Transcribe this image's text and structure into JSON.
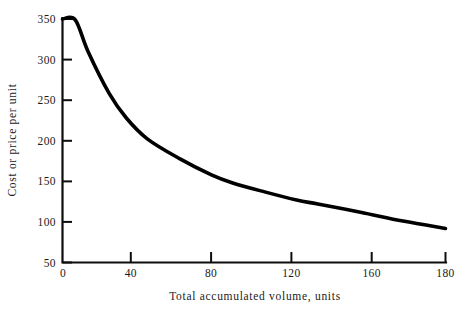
{
  "chart_data": {
    "type": "line",
    "title": "",
    "xlabel": "Total accumulated volume, units",
    "ylabel": "Cost or price per unit",
    "xlim": [
      0,
      180
    ],
    "ylim": [
      50,
      350
    ],
    "grid": false,
    "legend": "none",
    "xticks": [
      0,
      40,
      80,
      120,
      160,
      180
    ],
    "xtick_labels": [
      "0",
      "40",
      "80",
      "120",
      "160",
      "180"
    ],
    "yticks": [
      50,
      100,
      150,
      200,
      250,
      300,
      350
    ],
    "ytick_labels": [
      "50",
      "100",
      "150",
      "200",
      "250",
      "300",
      "350"
    ],
    "series": [
      {
        "name": "Cost or price per unit",
        "color": "#000000",
        "x": [
          0,
          6,
          12,
          22,
          30,
          40,
          55,
          70,
          80,
          95,
          110,
          120,
          140,
          160,
          180
        ],
        "values": [
          350,
          349,
          310,
          258,
          228,
          202,
          178,
          158,
          148,
          137,
          127,
          122,
          112,
          101,
          92
        ]
      }
    ]
  },
  "axis": {
    "y_title": "Cost or price per unit",
    "x_title": "Total accumulated volume, units"
  }
}
